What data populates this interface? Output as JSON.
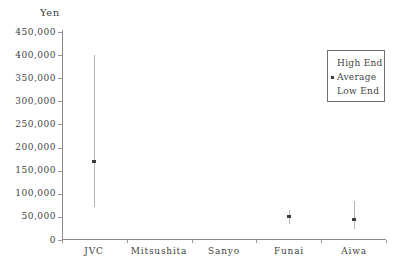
{
  "chart_data": {
    "type": "scatter",
    "subtype": "high-low-average-range",
    "title": "",
    "ylabel": "Yen",
    "xlabel": "",
    "categories": [
      "JVC",
      "Mitsushita",
      "Sanyo",
      "Funai",
      "Aiwa"
    ],
    "series": [
      {
        "name": "High End",
        "values": [
          400000,
          null,
          null,
          65000,
          85000
        ]
      },
      {
        "name": "Average",
        "values": [
          170000,
          null,
          null,
          50000,
          45000
        ]
      },
      {
        "name": "Low End",
        "values": [
          72000,
          null,
          null,
          35000,
          25000
        ]
      }
    ],
    "ylim": [
      0,
      450000
    ],
    "yticks": [
      0,
      50000,
      100000,
      150000,
      200000,
      250000,
      300000,
      350000,
      400000,
      450000
    ],
    "ytick_labels": [
      "0",
      "50,000",
      "100,000",
      "150,000",
      "200,000",
      "250,000",
      "300,000",
      "350,000",
      "400,000",
      "450,000"
    ],
    "grid": false,
    "legend": {
      "position": "top-right",
      "entries": [
        "High End",
        "Average",
        "Low End"
      ],
      "marker_entry": "Average"
    }
  },
  "colors": {
    "background": "#ffffff",
    "axis": "#8a8a8a",
    "range_line": "#b4b4b4",
    "marker": "#3c3c3c",
    "text": "#3f3f3f",
    "legend_border": "#6f6f6f"
  }
}
